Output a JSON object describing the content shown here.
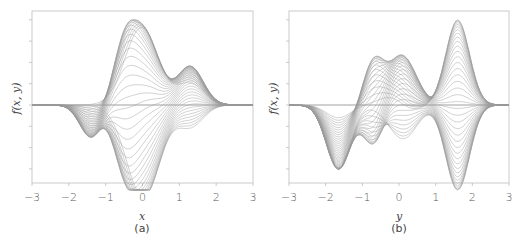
{
  "chart_data": [
    {
      "type": "line",
      "panel": "(a)",
      "xlabel": "x",
      "ylabel": "f(x, y)",
      "xlim": [
        -3,
        3
      ],
      "xticks": [
        "−3",
        "−2",
        "−1",
        "0",
        "1",
        "2",
        "3"
      ],
      "yticks_labeled": false,
      "grid": false,
      "legend": null,
      "description": "Family of ~40 gray curves f(x, y) plotted vs x for varying y; envelope peaks near x=0 (max ≈ +1.0), secondary peaks near x=-0.5 (≈+0.48) and x=1.3 (≈+0.45), minima near x=0.2 (≈-0.84) and x=-1.4 (≈-0.38)",
      "envelope": {
        "x": [
          -3,
          -2.5,
          -2,
          -1.5,
          -1.4,
          -1,
          -0.5,
          0,
          0.2,
          0.5,
          1,
          1.3,
          1.5,
          2,
          2.5,
          3
        ],
        "upper": [
          0,
          0.01,
          0.06,
          0.2,
          0.24,
          0.55,
          0.82,
          1.0,
          0.97,
          0.78,
          0.5,
          0.45,
          0.42,
          0.15,
          0.03,
          0
        ],
        "lower": [
          0,
          -0.03,
          -0.15,
          -0.36,
          -0.38,
          -0.25,
          -0.55,
          -0.78,
          -0.84,
          -0.65,
          -0.22,
          -0.08,
          -0.04,
          -0.01,
          0,
          0
        ]
      }
    },
    {
      "type": "line",
      "panel": "(b)",
      "xlabel": "y",
      "ylabel": "f(x, y)",
      "xlim": [
        -3,
        3
      ],
      "xticks": [
        "−3",
        "−2",
        "−1",
        "0",
        "1",
        "2",
        "3"
      ],
      "yticks_labeled": false,
      "grid": false,
      "legend": null,
      "description": "Family of ~40 gray curves f(x, y) plotted vs y for varying x; envelope peaks near y=1.6 (max ≈ +1.0), secondary peaks near y=-0.7 (≈+0.47) and y=0 (≈+0.44), minima near y=-1.6 (≈-0.84) and y=0.2 (≈-0.38)",
      "envelope": {
        "x": [
          -3,
          -2.5,
          -2,
          -1.6,
          -1,
          -0.7,
          -0.3,
          0,
          0.2,
          0.7,
          1,
          1.6,
          2,
          2.5,
          3
        ],
        "upper": [
          0,
          0.0,
          0.01,
          0.02,
          0.1,
          0.47,
          0.38,
          0.44,
          0.42,
          0.28,
          0.55,
          1.0,
          0.7,
          0.15,
          0.02
        ],
        "lower": [
          0,
          -0.1,
          -0.5,
          -0.84,
          -0.3,
          -0.05,
          -0.25,
          -0.33,
          -0.38,
          -0.28,
          -0.05,
          -0.01,
          0,
          0,
          0
        ]
      }
    }
  ],
  "panels": {
    "a": {
      "xlabel": "x",
      "ylabel": "f(x, y)",
      "caption": "(a)",
      "ticks": [
        "−3",
        "−2",
        "−1",
        "0",
        "1",
        "2",
        "3"
      ]
    },
    "b": {
      "xlabel": "y",
      "ylabel": "f(x, y)",
      "caption": "(b)",
      "ticks": [
        "−3",
        "−2",
        "−1",
        "0",
        "1",
        "2",
        "3"
      ]
    }
  },
  "colors": {
    "curve": "#9a9a9a",
    "axis": "#bdbdbd",
    "text": "#555555"
  }
}
